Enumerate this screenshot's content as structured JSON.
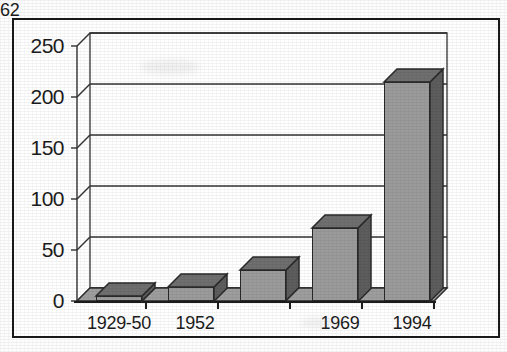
{
  "figure": {
    "kind": "scanned-bar-chart-image",
    "frame_color": "#1a1a1a",
    "background": "#ffffff"
  },
  "chart_data": {
    "type": "bar",
    "title": "",
    "subtitle": "",
    "xlabel": "",
    "ylabel": "",
    "categories": [
      "1929-50",
      "1952",
      "1962",
      "1969",
      "1994"
    ],
    "values": [
      5,
      14,
      30,
      72,
      215
    ],
    "ylim": [
      0,
      250
    ],
    "yticks": [
      0,
      50,
      100,
      150,
      200,
      250
    ],
    "ytick_labels": [
      "0",
      "50",
      "100",
      "150",
      "200",
      "250"
    ],
    "grid": true,
    "grid_axis": "y",
    "legend": null,
    "legend_position": "none",
    "style_3d": true,
    "annotations": [],
    "series": [
      {
        "name": "series-1",
        "values": [
          5,
          14,
          30,
          72,
          215
        ],
        "front_color": "#9b9b9b",
        "side_color": "#5d5d5d",
        "top_color": "#6f6f6f",
        "edge_color": "#2a2a2a"
      }
    ]
  },
  "axes": {
    "y_tick_0": "0",
    "y_tick_1": "50",
    "y_tick_2": "100",
    "y_tick_3": "150",
    "y_tick_4": "200",
    "y_tick_5": "250",
    "x_cat_0": "1929-50",
    "x_cat_1": "1952",
    "x_cat_2": "1962",
    "x_cat_3": "1969",
    "x_cat_4": "1994"
  }
}
